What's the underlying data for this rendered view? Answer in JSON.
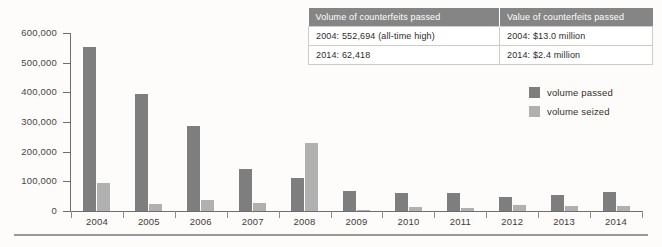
{
  "chart_data": {
    "type": "bar",
    "title": "",
    "subtitle": "",
    "xlabel": "",
    "ylabel": "",
    "ylim": [
      0,
      600000
    ],
    "ytick_values": [
      600000,
      500000,
      400000,
      300000,
      200000,
      100000,
      0
    ],
    "ytick_labels": [
      "600,000",
      "500,000",
      "400,000",
      "300,000",
      "200,000",
      "100,000",
      "0"
    ],
    "grid": false,
    "legend_position": "right",
    "categories": [
      "2004",
      "2005",
      "2006",
      "2007",
      "2008",
      "2009",
      "2010",
      "2011",
      "2012",
      "2013",
      "2014"
    ],
    "series": [
      {
        "name": "volume passed",
        "color": "#7e7e7e",
        "values": [
          552694,
          396000,
          285000,
          140000,
          110000,
          67000,
          60000,
          61000,
          48000,
          55000,
          62418
        ]
      },
      {
        "name": "volume seized",
        "color": "#b0b0b0",
        "values": [
          95000,
          22000,
          37000,
          27000,
          230000,
          5000,
          12000,
          10000,
          20000,
          16000,
          17000
        ]
      }
    ]
  },
  "legend": {
    "items": [
      {
        "label": "volume passed",
        "color": "#7e7e7e"
      },
      {
        "label": "volume seized",
        "color": "#b0b0b0"
      }
    ]
  },
  "table": {
    "headers": [
      "Volume of counterfeits passed",
      "Value of counterfeits passed"
    ],
    "rows": [
      [
        "2004: 552,694 (all-time high)",
        "2004: $13.0 million"
      ],
      [
        "2014: 62,418",
        "2014: $2.4 million"
      ]
    ]
  },
  "colors": {
    "background": "#fdfcfa",
    "passed_bar": "#7e7e7e",
    "seized_bar": "#b0b0b0",
    "table_header_bg": "#858585",
    "axis": "#6e6e6e",
    "rule": "#9a9a9a"
  }
}
